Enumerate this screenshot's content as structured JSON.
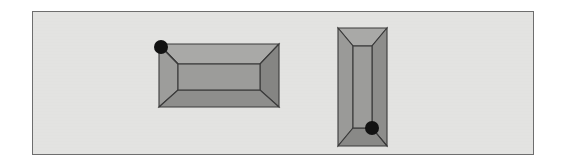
{
  "figure": {
    "background_color": "#ffffff",
    "panel": {
      "name": "figure-panel",
      "fill_color": "#e3e3e1",
      "border_color": "#6e6e6e",
      "x": 32,
      "y": 11,
      "width": 502,
      "height": 144
    },
    "palette": {
      "outline": "#3a3a3a",
      "bevel_top": "#a8a8a6",
      "bevel_bottom": "#8d8d8b",
      "bevel_left": "#9a9a98",
      "bevel_right": "#8a8a88",
      "inner_fill": "#9b9b99",
      "marker": "#121212"
    },
    "shapes": [
      {
        "name": "horizontal-box",
        "orientation": "horizontal",
        "outer": {
          "x": 0,
          "y": 0,
          "width": 120,
          "height": 63
        },
        "inner": {
          "x": 19,
          "y": 20,
          "width": 84,
          "height": 26
        },
        "marker": {
          "x": 2,
          "y": 4,
          "radius": 7,
          "corner": "top-left"
        }
      },
      {
        "name": "vertical-box",
        "orientation": "vertical",
        "outer": {
          "x": 0,
          "y": 0,
          "width": 50,
          "height": 122
        },
        "inner": {
          "x": 15,
          "y": 18,
          "width": 20,
          "height": 100
        },
        "marker": {
          "x": 34,
          "y": 100,
          "radius": 7,
          "corner": "bottom-right"
        }
      }
    ],
    "marker_count": 2,
    "shape_count": 2
  }
}
